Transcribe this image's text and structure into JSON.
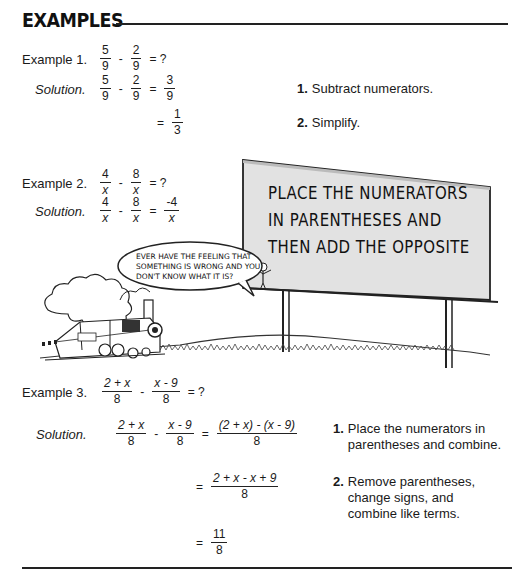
{
  "section": {
    "title": "EXAMPLES"
  },
  "example1": {
    "label": "Example 1.",
    "problem": {
      "a_num": "5",
      "a_den": "9",
      "op": "-",
      "b_num": "2",
      "b_den": "9",
      "eq": "= ?"
    },
    "solution_label": "Solution.",
    "solution": {
      "a_num": "5",
      "a_den": "9",
      "op": "-",
      "b_num": "2",
      "b_den": "9",
      "eq": "=",
      "r_num": "3",
      "r_den": "9"
    },
    "simplified": {
      "eq": "=",
      "num": "1",
      "den": "3"
    },
    "steps": [
      {
        "n": "1.",
        "text": "Subtract numerators."
      },
      {
        "n": "2.",
        "text": "Simplify."
      }
    ]
  },
  "example2": {
    "label": "Example 2.",
    "problem": {
      "a_num": "4",
      "a_den": "x",
      "op": "-",
      "b_num": "8",
      "b_den": "x",
      "eq": "= ?"
    },
    "solution_label": "Solution.",
    "solution": {
      "a_num": "4",
      "a_den": "x",
      "op": "-",
      "b_num": "8",
      "b_den": "x",
      "eq": "=",
      "r_num": "-4",
      "r_den": "x"
    }
  },
  "cartoon": {
    "speech_bubble": [
      "EVER HAVE THE FEELING THAT",
      "SOMETHING IS WRONG AND YOU",
      "DON'T KNOW WHAT IT IS?"
    ],
    "billboard": [
      "PLACE THE NUMERATORS",
      "IN PARENTHESES AND",
      "THEN ADD THE OPPOSITE"
    ]
  },
  "example3": {
    "label": "Example 3.",
    "problem": {
      "a_num": "2 + x",
      "a_den": "8",
      "op": "-",
      "b_num": "x - 9",
      "b_den": "8",
      "eq": "= ?"
    },
    "solution_label": "Solution.",
    "line1": {
      "a_num": "2 + x",
      "a_den": "8",
      "op": "-",
      "b_num": "x - 9",
      "b_den": "8",
      "eq": "=",
      "r_num": "(2 + x) - (x - 9)",
      "r_den": "8"
    },
    "line2": {
      "eq": "=",
      "num": "2 + x - x + 9",
      "den": "8"
    },
    "line3": {
      "eq": "=",
      "num": "11",
      "den": "8"
    },
    "steps": [
      {
        "n": "1.",
        "text": [
          "Place the numerators in",
          "parentheses and combine."
        ]
      },
      {
        "n": "2.",
        "text": [
          "Remove parentheses,",
          "change signs, and",
          "combine like terms."
        ]
      }
    ]
  }
}
